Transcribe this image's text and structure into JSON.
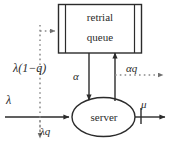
{
  "diagram": {
    "nodes": [
      {
        "id": "retrial-queue",
        "shape": "rectangle",
        "line1": "retrial",
        "line2": "queue"
      },
      {
        "id": "server",
        "shape": "ellipse",
        "label": "server"
      }
    ],
    "labels": {
      "arrival_rate": "λ",
      "blocked_to_queue": "λ(1−q)",
      "lost_or_balk": "λq",
      "retrial_to_server": "α",
      "retrial_loss": "αq",
      "service_rate": "μ"
    },
    "colors": {
      "stroke": "#2b2b2b",
      "dotted": "#8a8a8a",
      "background": "#ffffff"
    },
    "edges": [
      {
        "from": "external",
        "to": "server",
        "label": "λ",
        "style": "solid"
      },
      {
        "from": "arrival-split",
        "to": "retrial-queue",
        "label": "λ(1−q)",
        "style": "dotted"
      },
      {
        "from": "arrival-split",
        "to": "exit-down",
        "label": "λq",
        "style": "dotted"
      },
      {
        "from": "retrial-queue",
        "to": "server",
        "label": "α",
        "style": "solid"
      },
      {
        "from": "server",
        "to": "retrial-queue",
        "label": "",
        "style": "solid"
      },
      {
        "from": "retrial-branch",
        "to": "exit-right",
        "label": "αq",
        "style": "dotted"
      },
      {
        "from": "server",
        "to": "departure",
        "label": "μ",
        "style": "solid"
      }
    ]
  }
}
